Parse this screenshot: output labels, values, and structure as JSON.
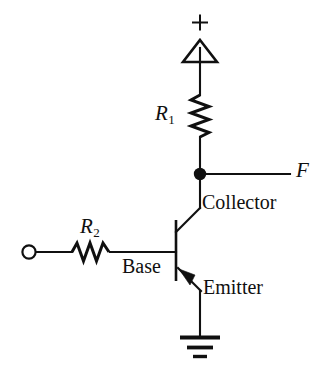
{
  "diagram": {
    "background_color": "#ffffff",
    "line_color": "#101010",
    "labels": {
      "supply_plus": "+",
      "r1_name": "R",
      "r1_subscript": "1",
      "r2_name": "R",
      "r2_subscript": "2",
      "output_node": "F",
      "collector": "Collector",
      "base": "Base",
      "emitter": "Emitter"
    },
    "components": [
      {
        "id": "supply-terminal",
        "name": "positive-supply-terminal",
        "symbol": "open-triangle-up",
        "label": "+"
      },
      {
        "id": "r1",
        "name": "resistor-r1",
        "symbol": "zigzag-vertical",
        "label": "R1"
      },
      {
        "id": "output-node",
        "name": "output-junction-dot",
        "symbol": "filled-dot",
        "label": "F"
      },
      {
        "id": "transistor",
        "name": "npn-transistor",
        "symbol": "bjt-npn",
        "terminals": [
          "Collector",
          "Base",
          "Emitter"
        ]
      },
      {
        "id": "r2",
        "name": "resistor-r2",
        "symbol": "zigzag-horizontal",
        "label": "R2"
      },
      {
        "id": "input-terminal",
        "name": "input-terminal",
        "symbol": "open-circle",
        "label": ""
      },
      {
        "id": "ground",
        "name": "ground-symbol",
        "symbol": "ground-three-bars",
        "label": ""
      }
    ]
  }
}
